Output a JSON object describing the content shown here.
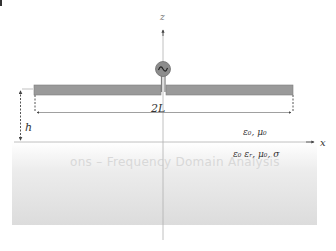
{
  "figure": {
    "type": "horizontal dipole antenna above lossy ground",
    "axes": {
      "z_label": "z",
      "x_label": "x"
    },
    "source": {
      "icon": "ac-source-icon",
      "symbol": "~"
    },
    "dimensions": {
      "length_label": "2L",
      "height_label": "h"
    },
    "media": {
      "upper_label": "ε₀, μ₀",
      "lower_label": "ε₀ εᵣ, μ₀, σ"
    },
    "background_bleed_text": "ons – Frequency Domain Analysis",
    "colors": {
      "rod": "#9a9a9a",
      "rod_border": "#7a7a7a",
      "source_fill": "#8c8c8c",
      "axis": "#aaaaaa",
      "ground_top": "#ffffff",
      "ground_bottom": "#dcdcdc",
      "dashed": "#555555"
    }
  }
}
